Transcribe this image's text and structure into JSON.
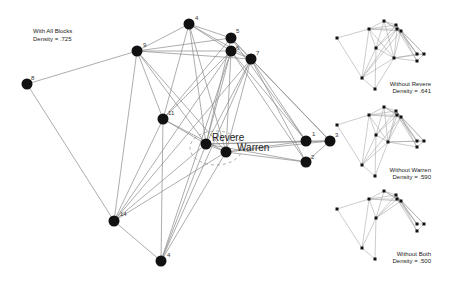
{
  "main_graph": {
    "title": "With All Blocks",
    "density_label": "Density = .725",
    "nodes": [
      {
        "id": "8",
        "label": "8",
        "x": 27,
        "y": 84
      },
      {
        "id": "9",
        "label": "9",
        "x": 137,
        "y": 51
      },
      {
        "id": "4a",
        "label": "4",
        "x": 189,
        "y": 24
      },
      {
        "id": "5",
        "label": "5",
        "x": 231,
        "y": 38
      },
      {
        "id": "6",
        "label": "6",
        "x": 231,
        "y": 51
      },
      {
        "id": "7",
        "label": "7",
        "x": 251,
        "y": 59
      },
      {
        "id": "11",
        "label": "11",
        "x": 163,
        "y": 119
      },
      {
        "id": "revere",
        "label": "Revere",
        "x": 206,
        "y": 144
      },
      {
        "id": "warren",
        "label": "Warren",
        "x": 226,
        "y": 152
      },
      {
        "id": "1",
        "label": "1",
        "x": 306,
        "y": 141
      },
      {
        "id": "3",
        "label": "3",
        "x": 330,
        "y": 141
      },
      {
        "id": "2",
        "label": "2",
        "x": 306,
        "y": 162
      },
      {
        "id": "14",
        "label": "14",
        "x": 114,
        "y": 221
      },
      {
        "id": "4b",
        "label": "4",
        "x": 161,
        "y": 261
      }
    ]
  },
  "subgraphs": [
    {
      "title": "Without Revere",
      "density_label": "Density = .641"
    },
    {
      "title": "Without Warren",
      "density_label": "Density = .590"
    },
    {
      "title": "Without Both",
      "density_label": "Density = .500"
    }
  ]
}
